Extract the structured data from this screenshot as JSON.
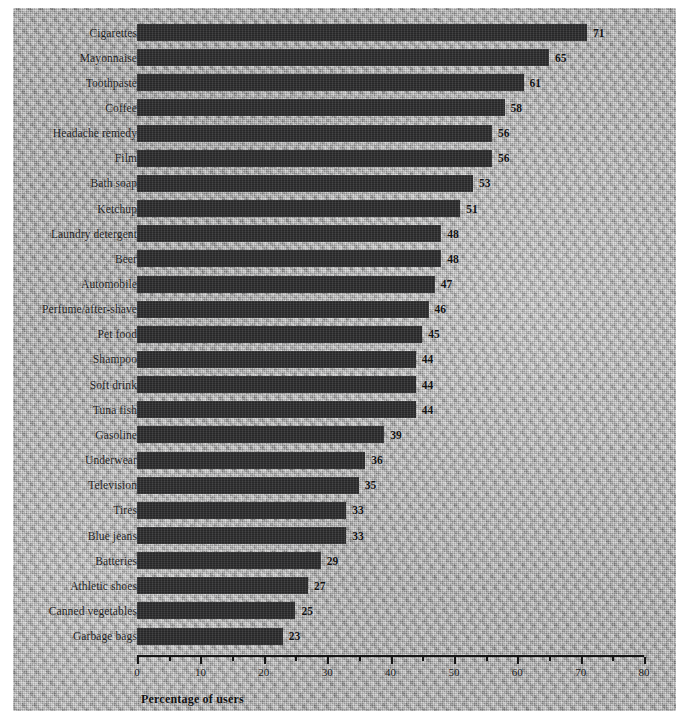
{
  "chart_data": {
    "type": "bar",
    "orientation": "horizontal",
    "title": "",
    "xlabel": "Percentage of users",
    "ylabel": "",
    "xlim": [
      0,
      80
    ],
    "xticks": [
      0,
      10,
      20,
      30,
      40,
      50,
      60,
      70,
      80
    ],
    "minor_tick_step": 5,
    "grid": false,
    "legend": null,
    "value_labels_shown": true,
    "bar_color": "#2f2f30",
    "background_color": "#a9a9a9",
    "categories": [
      "Cigarettes",
      "Mayonnaise",
      "Toothpaste",
      "Coffee",
      "Headache remedy",
      "Film",
      "Bath soap",
      "Ketchup",
      "Laundry detergent",
      "Beer",
      "Automobile",
      "Perfume/after-shave",
      "Pet food",
      "Shampoo",
      "Soft drink",
      "Tuna fish",
      "Gasoline",
      "Underwear",
      "Television",
      "Tires",
      "Blue jeans",
      "Batteries",
      "Athletic shoes",
      "Canned vegetables",
      "Garbage bags"
    ],
    "values": [
      71,
      65,
      61,
      58,
      56,
      56,
      53,
      51,
      48,
      48,
      47,
      46,
      45,
      44,
      44,
      44,
      39,
      36,
      35,
      33,
      33,
      29,
      27,
      25,
      23
    ]
  }
}
